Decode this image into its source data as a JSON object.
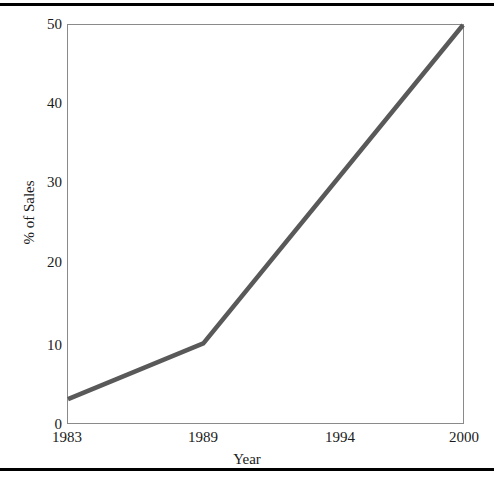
{
  "chart_data": {
    "type": "line",
    "title": "",
    "xlabel": "Year",
    "ylabel": "% of Sales",
    "x": [
      1983,
      1989,
      1994,
      2000
    ],
    "values": [
      3,
      10,
      28,
      50
    ],
    "series": [
      {
        "name": "% of Sales",
        "points": [
          {
            "x": 1983,
            "y": 3
          },
          {
            "x": 1989,
            "y": 10
          },
          {
            "x": 2000,
            "y": 50
          }
        ],
        "color": "#595959"
      }
    ],
    "xtick_labels": [
      "1983",
      "1989",
      "1994",
      "2000"
    ],
    "ytick_labels": [
      "0",
      "10",
      "20",
      "30",
      "40",
      "50"
    ],
    "ytick_values": [
      0,
      10,
      20,
      30,
      40,
      50
    ],
    "ylim": [
      0,
      50
    ],
    "xlim": [
      1983,
      2000
    ],
    "grid": false,
    "legend": false,
    "legend_position": "none",
    "line_color": "#595959",
    "frame_color": "#8a8a8a",
    "rule_color": "#000000",
    "annotations": []
  },
  "layout": {
    "xtick_pixels": [
      67,
      203,
      340,
      464
    ],
    "ytick_pixels": [
      424,
      345,
      262,
      182,
      103,
      24
    ]
  }
}
